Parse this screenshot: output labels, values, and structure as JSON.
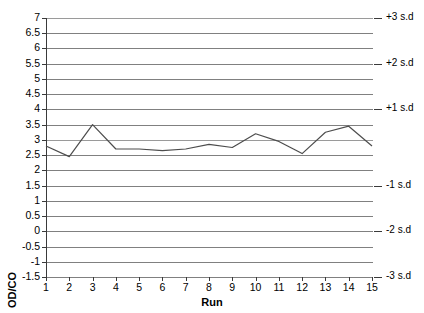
{
  "chart_data": {
    "type": "line",
    "title": "",
    "xlabel": "Run",
    "ylabel": "OD/CO",
    "x": [
      1,
      2,
      3,
      4,
      5,
      6,
      7,
      8,
      9,
      10,
      11,
      12,
      13,
      14,
      15
    ],
    "categories": [
      "1",
      "2",
      "3",
      "4",
      "5",
      "6",
      "7",
      "8",
      "9",
      "10",
      "11",
      "12",
      "13",
      "14",
      "15"
    ],
    "values": [
      2.8,
      2.45,
      3.5,
      2.7,
      2.7,
      2.65,
      2.7,
      2.85,
      2.75,
      3.2,
      2.95,
      2.55,
      3.25,
      3.45,
      2.8
    ],
    "series": [
      {
        "name": "OD/CO",
        "values": [
          2.8,
          2.45,
          3.5,
          2.7,
          2.7,
          2.65,
          2.7,
          2.85,
          2.75,
          3.2,
          2.95,
          2.55,
          3.25,
          3.45,
          2.8
        ],
        "color": "#4d4d4d"
      }
    ],
    "ylim": [
      -1.5,
      7
    ],
    "xlim": [
      1,
      15
    ],
    "ytick_step": 0.5,
    "yticks": [
      7,
      6.5,
      6,
      5.5,
      5,
      4.5,
      4,
      3.5,
      3,
      2.5,
      2,
      1.5,
      1,
      0.5,
      0,
      -0.5,
      -1,
      -1.5
    ],
    "ytick_labels": [
      "7",
      "6.5",
      "6",
      "5.5",
      "5",
      "4.5",
      "4",
      "3.5",
      "3",
      "2.5",
      "2",
      "1.5",
      "1",
      "0.5",
      "0",
      "-0.5",
      "-1",
      "-1.5"
    ],
    "xticks": [
      1,
      2,
      3,
      4,
      5,
      6,
      7,
      8,
      9,
      10,
      11,
      12,
      13,
      14,
      15
    ],
    "xtick_labels": [
      "1",
      "2",
      "3",
      "4",
      "5",
      "6",
      "7",
      "8",
      "9",
      "10",
      "11",
      "12",
      "13",
      "14",
      "15"
    ],
    "grid": true,
    "grid_orientation": "horizontal",
    "legend": false,
    "legend_position": "none",
    "mean_line_value": 3,
    "secondary_axis": {
      "position": "right",
      "label": "",
      "ticks": [
        {
          "value": 7,
          "label": "+3 s.d"
        },
        {
          "value": 5.5,
          "label": "+2 s.d"
        },
        {
          "value": 4,
          "label": "+1 s.d"
        },
        {
          "value": 1.5,
          "label": "-1 s.d"
        },
        {
          "value": 0,
          "label": "-2 s.d"
        },
        {
          "value": -1.5,
          "label": "-3 s.d"
        }
      ]
    },
    "colors": {
      "line": "#4d4d4d",
      "grid": "#808080",
      "grid_major": "#9a9a9a",
      "axis": "#3a3a3a",
      "background": "#ffffff",
      "text": "#000000"
    }
  }
}
